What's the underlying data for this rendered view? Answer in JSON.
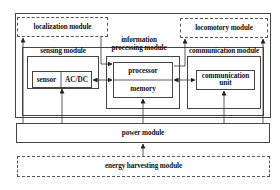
{
  "diagram": {
    "type": "block-diagram",
    "modules": {
      "localization": "localization module",
      "locomotory": "locomotory module",
      "sensing": "sensing module",
      "info_line1": "information",
      "info_line2": "processing  module",
      "communication": "communication module",
      "power": "power module",
      "energy": "energy harvesting module"
    },
    "components": {
      "sensor": "sensor",
      "acdc": "AC/DC",
      "processor": "processor",
      "memory": "memory",
      "comm_unit_line1": "communication",
      "comm_unit_line2": "unit"
    },
    "connections": [
      {
        "from": "AC/DC",
        "to": "processor/memory",
        "type": "bidirectional"
      },
      {
        "from": "processor/memory",
        "to": "communication unit",
        "type": "bidirectional"
      },
      {
        "from": "localization module",
        "to": "information processing module",
        "type": "directed"
      },
      {
        "from": "information processing module",
        "to": "locomotory module",
        "type": "directed"
      },
      {
        "from": "power module",
        "to": "localization module",
        "type": "directed"
      },
      {
        "from": "power module",
        "to": "sensor/AC-DC",
        "type": "directed"
      },
      {
        "from": "power module",
        "to": "processor/memory",
        "type": "directed"
      },
      {
        "from": "power module",
        "to": "communication unit",
        "type": "directed"
      },
      {
        "from": "power module",
        "to": "locomotory module",
        "type": "directed"
      },
      {
        "from": "energy harvesting module",
        "to": "power module",
        "type": "directed"
      }
    ],
    "colors": {
      "line": "#444444",
      "background": "#ffffff"
    }
  }
}
